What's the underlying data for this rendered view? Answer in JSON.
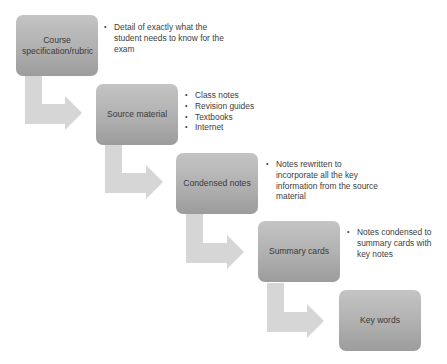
{
  "diagram": {
    "type": "bending-process-flow",
    "colors": {
      "box_top": "#c4c4c4",
      "box_bottom": "#9c9c9c",
      "arrow": "#d6d6d6",
      "text": "#3a3a3a"
    },
    "steps": [
      {
        "label": "Course specification/rubric",
        "notes": [
          "Detail of exactly what the student needs to know for the exam"
        ]
      },
      {
        "label": "Source material",
        "notes": [
          "Class notes",
          "Revision guides",
          "Textbooks",
          "Internet"
        ]
      },
      {
        "label": "Condensed notes",
        "notes": [
          "Notes rewritten to incorporate all the key information from the source material"
        ]
      },
      {
        "label": "Summary cards",
        "notes": [
          "Notes condensed to summary cards with key notes"
        ]
      },
      {
        "label": "Key words",
        "notes": []
      }
    ]
  }
}
